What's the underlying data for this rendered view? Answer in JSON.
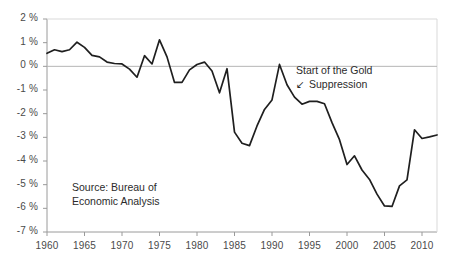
{
  "chart_data": {
    "type": "line",
    "title": "",
    "subtitle": "",
    "xlabel": "",
    "ylabel": "",
    "xlim": [
      1960,
      2012
    ],
    "ylim": [
      -7,
      2
    ],
    "grid": "zero-line-only",
    "legend": "none",
    "y_tick_labels": [
      "2 %",
      "1 %",
      "0 %",
      "-1 %",
      "-2 %",
      "-3 %",
      "-4 %",
      "-5 %",
      "-6 %",
      "-7 %"
    ],
    "y_ticks": [
      2,
      1,
      0,
      -1,
      -2,
      -3,
      -4,
      -5,
      -6,
      -7
    ],
    "x_tick_labels": [
      "1960",
      "1965",
      "1970",
      "1975",
      "1980",
      "1985",
      "1990",
      "1995",
      "2000",
      "2005",
      "2010"
    ],
    "x_ticks": [
      1960,
      1965,
      1970,
      1975,
      1980,
      1985,
      1990,
      1995,
      2000,
      2005,
      2010
    ],
    "line_color": "#1f1f1f",
    "axis_color": "#9a9a9a",
    "series": [
      {
        "name": "balance",
        "x": [
          1960,
          1961,
          1962,
          1963,
          1964,
          1965,
          1966,
          1967,
          1968,
          1969,
          1970,
          1971,
          1972,
          1973,
          1974,
          1975,
          1976,
          1977,
          1978,
          1979,
          1980,
          1981,
          1982,
          1983,
          1984,
          1985,
          1986,
          1987,
          1988,
          1989,
          1990,
          1991,
          1992,
          1993,
          1994,
          1995,
          1996,
          1997,
          1998,
          1999,
          2000,
          2001,
          2002,
          2003,
          2004,
          2005,
          2006,
          2007,
          2008,
          2009,
          2010,
          2011,
          2012
        ],
        "values": [
          0.55,
          0.7,
          0.62,
          0.7,
          1.02,
          0.8,
          0.46,
          0.4,
          0.18,
          0.12,
          0.1,
          -0.12,
          -0.46,
          0.45,
          0.1,
          1.12,
          0.4,
          -0.68,
          -0.68,
          -0.15,
          0.08,
          0.18,
          -0.2,
          -1.12,
          -0.1,
          -2.78,
          -3.25,
          -3.35,
          -2.52,
          -1.82,
          -1.42,
          0.08,
          -0.78,
          -1.3,
          -1.6,
          -1.48,
          -1.48,
          -1.58,
          -2.38,
          -3.1,
          -4.15,
          -3.78,
          -4.38,
          -4.78,
          -5.4,
          -5.9,
          -5.92,
          -5.05,
          -4.8,
          -2.68,
          -3.05,
          -2.98,
          -2.9
        ]
      }
    ],
    "annotations": [
      {
        "name": "gold-suppression-note",
        "line1": "Start of the Gold",
        "arrow": "↙",
        "line2": "Suppression",
        "points_to_year": 1991
      },
      {
        "name": "source-note",
        "line1": "Source: Bureau of",
        "line2": "Economic Analysis"
      }
    ]
  }
}
